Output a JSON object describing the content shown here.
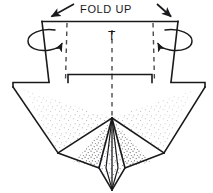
{
  "diagram": {
    "title": "FOLD UP",
    "background_color": "#ffffff",
    "ink_color": "#1a1a1c",
    "stipple_color": "#3a3a3c",
    "labels": {
      "fold_up": "FOLD UP",
      "fold_up_first": "F",
      "fold_up_rest_1": "OLD",
      "fold_up_rest_2": "UP",
      "center_mark": "T"
    },
    "annotations": [
      {
        "name": "fold-up-text",
        "text": "FOLD UP",
        "x": 106,
        "y": 11
      },
      {
        "name": "center-t-mark",
        "text": "T",
        "x": 106,
        "y": 38
      }
    ],
    "arrows": [
      {
        "name": "fold-arrow-left",
        "direction": "down-left",
        "from_x": 73,
        "from_y": 5,
        "to_x": 49,
        "to_y": 18
      },
      {
        "name": "fold-arrow-right",
        "direction": "down-right",
        "from_x": 158,
        "from_y": 5,
        "to_x": 172,
        "to_y": 18
      }
    ],
    "rotation_arrows": [
      {
        "name": "rotate-curl-left",
        "side": "left",
        "cx": 44,
        "cy": 40
      },
      {
        "name": "rotate-curl-right",
        "side": "right",
        "cx": 172,
        "cy": 40
      }
    ],
    "fold_lines": [
      {
        "name": "fold-line-left",
        "style": "dashed",
        "x1": 67,
        "y1": 22,
        "x2": 65,
        "y2": 82
      },
      {
        "name": "fold-line-right",
        "style": "dashed",
        "x1": 153,
        "y1": 22,
        "x2": 155,
        "y2": 82
      },
      {
        "name": "center-axis",
        "style": "dashed",
        "x1": 112,
        "y1": 27,
        "x2": 112,
        "y2": 118
      }
    ],
    "shape_paths": {
      "neck_outline": "M 42,21 L 178,21 L 171,82 L 152,82 L 152,74 L 68,74 L 68,82 L 49,82 Z",
      "body_outline": "M 13,82 L 13,86 L 58,153 L 112,118 L 164,153 L 205,88 L 205,82",
      "center_diamond": "M 112,118 L 125,168 L 112,190 L 99,168 Z"
    },
    "vertices": {
      "neck_top_left": [
        42,
        21
      ],
      "neck_top_right": [
        178,
        21
      ],
      "neck_bottom_left": [
        49,
        82
      ],
      "neck_bottom_right": [
        171,
        82
      ],
      "body_left_corner": [
        13,
        82
      ],
      "body_right_corner": [
        205,
        82
      ],
      "body_left_point": [
        58,
        153
      ],
      "body_right_point": [
        164,
        153
      ],
      "center_apex": [
        112,
        118
      ],
      "center_bottom": [
        112,
        190
      ]
    }
  }
}
